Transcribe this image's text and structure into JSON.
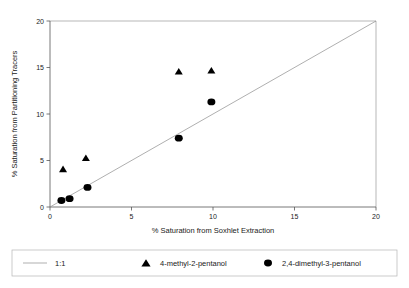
{
  "chart_data": {
    "type": "scatter",
    "title": "",
    "xlabel": "% Saturation from Soxhlet Extraction",
    "ylabel": "% Saturation from Partitioning Tracers",
    "xlim": [
      0,
      20
    ],
    "ylim": [
      0,
      20
    ],
    "xticks": [
      0,
      5,
      10,
      15,
      20
    ],
    "yticks": [
      0,
      5,
      10,
      15,
      20
    ],
    "xtick_labels": [
      "0",
      "5",
      "10",
      "15",
      "20"
    ],
    "ytick_labels": [
      "0",
      "5",
      "10",
      "15",
      "20"
    ],
    "grid": false,
    "legend_position": "bottom",
    "reference_line": {
      "name": "1:1",
      "label": "1:1",
      "marker": "line",
      "from": [
        0,
        0
      ],
      "to": [
        20,
        20
      ],
      "color": "#8d8d8d"
    },
    "series": [
      {
        "name": "4-methyl-2-pentanol",
        "label": "4-methyl-2-pentanol",
        "marker": "triangle",
        "color": "#000000",
        "points": [
          [
            0.8,
            4.1
          ],
          [
            2.2,
            5.3
          ],
          [
            7.9,
            14.6
          ],
          [
            9.9,
            14.7
          ]
        ]
      },
      {
        "name": "2,4-dimethyl-3-pentanol",
        "label": "2,4-dimethyl-3-pentanol",
        "marker": "circle",
        "color": "#000000",
        "points": [
          [
            0.7,
            0.7
          ],
          [
            1.2,
            0.9
          ],
          [
            2.3,
            2.1
          ],
          [
            7.9,
            7.4
          ],
          [
            9.9,
            11.3
          ]
        ]
      }
    ]
  },
  "legend": {
    "entries": [
      {
        "label": "1:1",
        "marker": "line"
      },
      {
        "label": "4-methyl-2-pentanol",
        "marker": "triangle"
      },
      {
        "label": "2,4-dimethyl-3-pentanol",
        "marker": "circle"
      }
    ]
  }
}
